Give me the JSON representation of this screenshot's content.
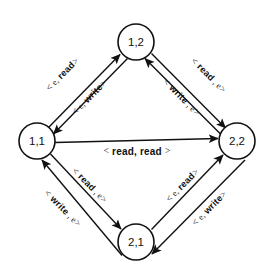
{
  "diagram": {
    "type": "directed-graph",
    "stroke_color": "#111111",
    "background_color": "#ffffff",
    "nodes": [
      {
        "id": "n12",
        "label": "1,2",
        "cx": 136,
        "cy": 42,
        "r": 18
      },
      {
        "id": "n11",
        "label": "1,1",
        "cx": 37,
        "cy": 141,
        "r": 18
      },
      {
        "id": "n22",
        "label": "2,2",
        "cx": 237,
        "cy": 141,
        "r": 18
      },
      {
        "id": "n21",
        "label": "2,1",
        "cx": 136,
        "cy": 242,
        "r": 18
      }
    ],
    "edges": [
      {
        "id": "e-11-to-12",
        "from": "1,1",
        "to": "1,2",
        "label": "< e, read>",
        "label_open": "<",
        "label_lite": "e,",
        "label_bold": "read",
        "label_close": ">",
        "position": "upper-left-outer",
        "label_x": 63,
        "label_y": 75,
        "rotation": -45
      },
      {
        "id": "e-12-to-11",
        "from": "1,2",
        "to": "1,1",
        "label": "< e, write>",
        "label_open": "<",
        "label_lite": "e,",
        "label_bold": "write",
        "label_close": ">",
        "position": "upper-left-inner",
        "label_x": 90,
        "label_y": 97,
        "rotation": -45
      },
      {
        "id": "e-12-to-22",
        "from": "1,2",
        "to": "2,2",
        "label": "< read , e>",
        "label_open": "<",
        "label_bold": "read",
        "label_lite": ", e",
        "label_close": ">",
        "position": "upper-right-outer",
        "label_x": 208,
        "label_y": 76,
        "rotation": 45
      },
      {
        "id": "e-22-to-12",
        "from": "2,2",
        "to": "1,2",
        "label": "< write , e>",
        "label_open": "<",
        "label_bold": "write",
        "label_lite": ", e",
        "label_close": ">",
        "position": "upper-right-inner",
        "label_x": 180,
        "label_y": 97,
        "rotation": 45
      },
      {
        "id": "e-11-to-22",
        "from": "1,1",
        "to": "2,2",
        "label": "< read, read >",
        "label_open": "<",
        "label_bold": "read, read",
        "label_close": ">",
        "position": "center-horizontal",
        "label_x": 137,
        "label_y": 151,
        "rotation": 0
      },
      {
        "id": "e-11-to-21",
        "from": "1,1",
        "to": "2,1",
        "label": "< read , e>",
        "label_open": "<",
        "label_bold": "read",
        "label_lite": ", e",
        "label_close": ">",
        "position": "lower-left-inner",
        "label_x": 88,
        "label_y": 186,
        "rotation": 45
      },
      {
        "id": "e-21-to-11",
        "from": "2,1",
        "to": "1,1",
        "label": "< write , e>",
        "label_open": "<",
        "label_bold": "write",
        "label_lite": ", e",
        "label_close": ">",
        "position": "lower-left-outer",
        "label_x": 62,
        "label_y": 208,
        "rotation": 45
      },
      {
        "id": "e-21-to-22",
        "from": "2,1",
        "to": "2,2",
        "label": "< e, read>",
        "label_open": "<",
        "label_lite": "e,",
        "label_bold": "read",
        "label_close": ">",
        "position": "lower-right-inner",
        "label_x": 182,
        "label_y": 186,
        "rotation": -45
      },
      {
        "id": "e-22-to-21",
        "from": "2,2",
        "to": "2,1",
        "label": "< e, write >",
        "label_open": "<",
        "label_lite": "e,",
        "label_bold": "write",
        "label_close": ">",
        "position": "lower-right-outer",
        "label_x": 209,
        "label_y": 208,
        "rotation": -45
      }
    ]
  }
}
